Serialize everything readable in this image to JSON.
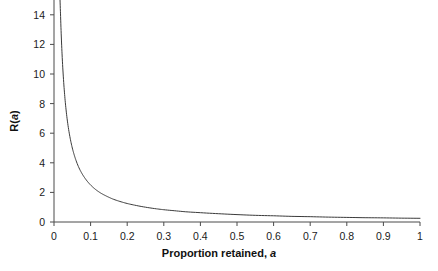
{
  "chart_data": {
    "type": "line",
    "title": "",
    "subtitle": "",
    "xlabel": "Proportion retained, a",
    "ylabel": "R(a)",
    "xlim": [
      0,
      1
    ],
    "ylim": [
      0,
      15
    ],
    "grid": false,
    "legend": null,
    "annotations": [],
    "xticks": [
      0,
      0.1,
      0.2,
      0.3,
      0.4,
      0.5,
      0.6,
      0.7,
      0.8,
      0.9,
      1
    ],
    "xtick_labels": [
      "0",
      "0.1",
      "0.2",
      "0.3",
      "0.4",
      "0.5",
      "0.6",
      "0.7",
      "0.8",
      "0.9",
      "1"
    ],
    "yticks": [
      0,
      2,
      4,
      6,
      8,
      10,
      12,
      14
    ],
    "ytick_labels": [
      "0",
      "2",
      "4",
      "6",
      "8",
      "10",
      "12",
      "14"
    ],
    "series": [
      {
        "name": "R(a)",
        "color": "#3a3a3a",
        "linewidth": 1,
        "x": [
          0.0165,
          0.018,
          0.02,
          0.022,
          0.025,
          0.028,
          0.031,
          0.035,
          0.04,
          0.045,
          0.05,
          0.055,
          0.06,
          0.07,
          0.08,
          0.09,
          0.1,
          0.11,
          0.12,
          0.13,
          0.14,
          0.15,
          0.16,
          0.18,
          0.2,
          0.22,
          0.25,
          0.28,
          0.3,
          0.33,
          0.36,
          0.4,
          0.45,
          0.5,
          0.55,
          0.6,
          0.65,
          0.7,
          0.75,
          0.8,
          0.85,
          0.9,
          0.95,
          1.0
        ],
        "y": [
          15.0,
          13.89,
          12.5,
          11.36,
          10.0,
          8.93,
          8.06,
          7.14,
          6.25,
          5.56,
          5.0,
          4.55,
          4.17,
          3.57,
          3.13,
          2.78,
          2.5,
          2.27,
          2.08,
          1.92,
          1.79,
          1.67,
          1.56,
          1.39,
          1.25,
          1.14,
          1.0,
          0.89,
          0.83,
          0.76,
          0.69,
          0.63,
          0.56,
          0.5,
          0.45,
          0.42,
          0.38,
          0.36,
          0.33,
          0.31,
          0.29,
          0.28,
          0.26,
          0.25
        ],
        "formula": "R(a) = 0.25/a"
      }
    ]
  },
  "axes": {
    "x_title": "Proportion retained, ",
    "x_title_italic": "a",
    "y_title_prefix": "R(",
    "y_title_italic": "a",
    "y_title_suffix": ")"
  },
  "ticks": {
    "x": [
      {
        "label": "0",
        "value": 0
      },
      {
        "label": "0.1",
        "value": 0.1
      },
      {
        "label": "0.2",
        "value": 0.2
      },
      {
        "label": "0.3",
        "value": 0.3
      },
      {
        "label": "0.4",
        "value": 0.4
      },
      {
        "label": "0.5",
        "value": 0.5
      },
      {
        "label": "0.6",
        "value": 0.6
      },
      {
        "label": "0.7",
        "value": 0.7
      },
      {
        "label": "0.8",
        "value": 0.8
      },
      {
        "label": "0.9",
        "value": 0.9
      },
      {
        "label": "1",
        "value": 1
      }
    ],
    "y": [
      {
        "label": "0",
        "value": 0
      },
      {
        "label": "2",
        "value": 2
      },
      {
        "label": "4",
        "value": 4
      },
      {
        "label": "6",
        "value": 6
      },
      {
        "label": "8",
        "value": 8
      },
      {
        "label": "10",
        "value": 10
      },
      {
        "label": "12",
        "value": 12
      },
      {
        "label": "14",
        "value": 14
      }
    ]
  },
  "style": {
    "background": "#ffffff",
    "axis_color": "#4a4a4a",
    "curve_color": "#3a3a3a",
    "text_color": "#1a1a1a"
  }
}
